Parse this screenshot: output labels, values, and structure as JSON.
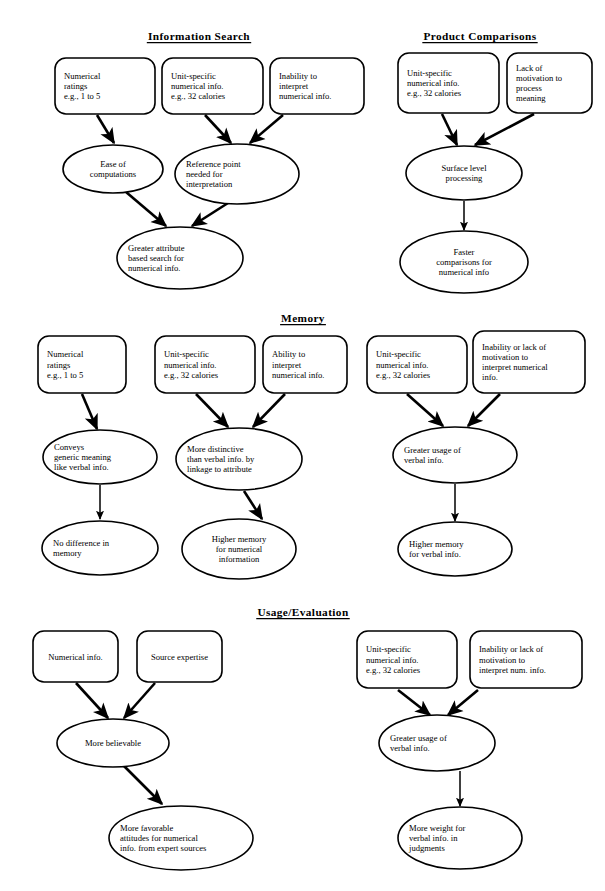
{
  "document": {
    "type": "conceptual-flowchart",
    "description": "Three-panel process model diagram of numerical versus verbal information effects"
  },
  "sections": [
    {
      "id": "information-search",
      "title": "Information Search",
      "nodes": [
        {
          "id": "is-n1",
          "shape": "rounded-rect",
          "lines": [
            "Numerical",
            "ratings",
            "e.g., 1 to 5"
          ]
        },
        {
          "id": "is-n2",
          "shape": "rounded-rect",
          "lines": [
            "Unit-specific",
            "numerical info.",
            "e.g., 32 calories"
          ]
        },
        {
          "id": "is-n3",
          "shape": "rounded-rect",
          "lines": [
            "Inability to",
            "interpret",
            "numerical info."
          ]
        },
        {
          "id": "is-n4",
          "shape": "ellipse",
          "lines": [
            "Ease of",
            "computations"
          ]
        },
        {
          "id": "is-n5",
          "shape": "ellipse",
          "lines": [
            "Reference point",
            "needed for",
            "interpretation"
          ]
        },
        {
          "id": "is-n6",
          "shape": "ellipse",
          "lines": [
            "Greater attribute",
            "based search for",
            "numerical info."
          ]
        }
      ],
      "edges": [
        {
          "from": "is-n1",
          "to": "is-n4"
        },
        {
          "from": "is-n2",
          "to": "is-n5"
        },
        {
          "from": "is-n3",
          "to": "is-n5"
        },
        {
          "from": "is-n4",
          "to": "is-n6"
        },
        {
          "from": "is-n5",
          "to": "is-n6"
        }
      ]
    },
    {
      "id": "product-comparisons",
      "title": "Product Comparisons",
      "nodes": [
        {
          "id": "pc-n1",
          "shape": "rounded-rect",
          "lines": [
            "Unit-specific",
            "numerical info.",
            "e.g., 32 calories"
          ]
        },
        {
          "id": "pc-n2",
          "shape": "rounded-rect",
          "lines": [
            "Lack of",
            "motivation to",
            "process",
            "meaning"
          ]
        },
        {
          "id": "pc-n3",
          "shape": "ellipse",
          "lines": [
            "Surface level",
            "processing"
          ]
        },
        {
          "id": "pc-n4",
          "shape": "ellipse",
          "lines": [
            "Faster",
            "comparisons for",
            "numerical info"
          ]
        }
      ],
      "edges": [
        {
          "from": "pc-n1",
          "to": "pc-n3"
        },
        {
          "from": "pc-n2",
          "to": "pc-n3"
        },
        {
          "from": "pc-n3",
          "to": "pc-n4"
        }
      ]
    },
    {
      "id": "memory",
      "title": "Memory",
      "nodes": [
        {
          "id": "me-n1",
          "shape": "rounded-rect",
          "lines": [
            "Numerical",
            "ratings",
            "e.g., 1 to 5"
          ]
        },
        {
          "id": "me-n2",
          "shape": "rounded-rect",
          "lines": [
            "Unit-specific",
            "numerical info.",
            "e.g., 32 calories"
          ]
        },
        {
          "id": "me-n3",
          "shape": "rounded-rect",
          "lines": [
            "Ability to",
            "interpret",
            "numerical info."
          ]
        },
        {
          "id": "me-n4",
          "shape": "rounded-rect",
          "lines": [
            "Unit-specific",
            "numerical info.",
            "e.g., 32 calories"
          ]
        },
        {
          "id": "me-n5",
          "shape": "rounded-rect",
          "lines": [
            "Inability or lack of",
            "motivation to",
            "interpret numerical",
            "info."
          ]
        },
        {
          "id": "me-n6",
          "shape": "ellipse",
          "lines": [
            "Conveys",
            "generic meaning",
            "like verbal info."
          ]
        },
        {
          "id": "me-n7",
          "shape": "ellipse",
          "lines": [
            "More distinctive",
            "than verbal info. by",
            "linkage to attribute"
          ]
        },
        {
          "id": "me-n8",
          "shape": "ellipse",
          "lines": [
            "Greater usage of",
            "verbal info."
          ]
        },
        {
          "id": "me-n9",
          "shape": "ellipse",
          "lines": [
            "No difference in",
            "memory"
          ]
        },
        {
          "id": "me-n10",
          "shape": "ellipse",
          "lines": [
            "Higher memory",
            "for numerical",
            "information"
          ]
        },
        {
          "id": "me-n11",
          "shape": "ellipse",
          "lines": [
            "Higher memory",
            "for verbal info."
          ]
        }
      ],
      "edges": [
        {
          "from": "me-n1",
          "to": "me-n6"
        },
        {
          "from": "me-n2",
          "to": "me-n7"
        },
        {
          "from": "me-n3",
          "to": "me-n7"
        },
        {
          "from": "me-n4",
          "to": "me-n8"
        },
        {
          "from": "me-n5",
          "to": "me-n8"
        },
        {
          "from": "me-n6",
          "to": "me-n9"
        },
        {
          "from": "me-n7",
          "to": "me-n10"
        },
        {
          "from": "me-n8",
          "to": "me-n11"
        }
      ]
    },
    {
      "id": "usage-evaluation",
      "title": "Usage/Evaluation",
      "nodes": [
        {
          "id": "ue-n1",
          "shape": "rounded-rect",
          "lines": [
            "Numerical info."
          ]
        },
        {
          "id": "ue-n2",
          "shape": "rounded-rect",
          "lines": [
            "Source expertise"
          ]
        },
        {
          "id": "ue-n3",
          "shape": "rounded-rect",
          "lines": [
            "Unit-specific",
            "numerical info.",
            "e.g., 32 calories"
          ]
        },
        {
          "id": "ue-n4",
          "shape": "rounded-rect",
          "lines": [
            "Inability or lack of",
            "motivation to",
            "interpret num. info."
          ]
        },
        {
          "id": "ue-n5",
          "shape": "ellipse",
          "lines": [
            "More believable"
          ]
        },
        {
          "id": "ue-n6",
          "shape": "ellipse",
          "lines": [
            "Greater usage of",
            "verbal info."
          ]
        },
        {
          "id": "ue-n7",
          "shape": "ellipse",
          "lines": [
            "More favorable",
            "attitudes for numerical",
            "info. from expert sources"
          ]
        },
        {
          "id": "ue-n8",
          "shape": "ellipse",
          "lines": [
            "More weight for",
            "verbal info. in",
            "judgments"
          ]
        }
      ],
      "edges": [
        {
          "from": "ue-n1",
          "to": "ue-n5"
        },
        {
          "from": "ue-n2",
          "to": "ue-n5"
        },
        {
          "from": "ue-n3",
          "to": "ue-n6"
        },
        {
          "from": "ue-n4",
          "to": "ue-n6"
        },
        {
          "from": "ue-n5",
          "to": "ue-n7"
        },
        {
          "from": "ue-n6",
          "to": "ue-n8"
        }
      ]
    }
  ],
  "colors": {
    "stroke": "#000000",
    "fill": "#ffffff",
    "text": "#000000",
    "background": "#ffffff"
  },
  "layout": {
    "titles": [
      {
        "id": "information-search",
        "cx": 199,
        "y": 40
      },
      {
        "id": "product-comparisons",
        "cx": 480,
        "y": 40
      },
      {
        "id": "memory",
        "cx": 303,
        "y": 322
      },
      {
        "id": "usage-evaluation",
        "cx": 303,
        "y": 616
      }
    ],
    "boxes": [
      {
        "id": "is-n1",
        "x": 55,
        "y": 58,
        "w": 100,
        "h": 56,
        "align": "left"
      },
      {
        "id": "is-n2",
        "x": 162,
        "y": 58,
        "w": 101,
        "h": 56,
        "align": "left"
      },
      {
        "id": "is-n3",
        "x": 270,
        "y": 58,
        "w": 94,
        "h": 56,
        "align": "left"
      },
      {
        "id": "pc-n1",
        "x": 398,
        "y": 53,
        "w": 101,
        "h": 60,
        "align": "left"
      },
      {
        "id": "pc-n2",
        "x": 507,
        "y": 53,
        "w": 85,
        "h": 60,
        "align": "left"
      },
      {
        "id": "me-n1",
        "x": 38,
        "y": 336,
        "w": 88,
        "h": 57,
        "align": "left"
      },
      {
        "id": "me-n2",
        "x": 155,
        "y": 336,
        "w": 100,
        "h": 57,
        "align": "left"
      },
      {
        "id": "me-n3",
        "x": 263,
        "y": 336,
        "w": 84,
        "h": 57,
        "align": "left"
      },
      {
        "id": "me-n4",
        "x": 367,
        "y": 336,
        "w": 100,
        "h": 57,
        "align": "left"
      },
      {
        "id": "me-n5",
        "x": 473,
        "y": 331,
        "w": 112,
        "h": 62,
        "align": "left"
      },
      {
        "id": "ue-n1",
        "x": 33,
        "y": 631,
        "w": 85,
        "h": 51,
        "align": "center"
      },
      {
        "id": "ue-n2",
        "x": 137,
        "y": 631,
        "w": 85,
        "h": 51,
        "align": "center"
      },
      {
        "id": "ue-n3",
        "x": 357,
        "y": 631,
        "w": 100,
        "h": 57,
        "align": "left"
      },
      {
        "id": "ue-n4",
        "x": 470,
        "y": 631,
        "w": 112,
        "h": 57,
        "align": "left"
      }
    ],
    "ellipses": [
      {
        "id": "is-n4",
        "cx": 113,
        "cy": 169,
        "rx": 50,
        "ry": 24,
        "align": "center"
      },
      {
        "id": "is-n5",
        "cx": 237,
        "cy": 174,
        "rx": 62,
        "ry": 30,
        "align": "left"
      },
      {
        "id": "is-n6",
        "cx": 180,
        "cy": 258,
        "rx": 63,
        "ry": 31,
        "align": "left"
      },
      {
        "id": "pc-n3",
        "cx": 464,
        "cy": 173,
        "rx": 58,
        "ry": 27,
        "align": "center"
      },
      {
        "id": "pc-n4",
        "cx": 464,
        "cy": 262,
        "rx": 64,
        "ry": 31,
        "align": "center"
      },
      {
        "id": "me-n6",
        "cx": 100,
        "cy": 457,
        "rx": 57,
        "ry": 27,
        "align": "left"
      },
      {
        "id": "me-n7",
        "cx": 239,
        "cy": 459,
        "rx": 63,
        "ry": 31,
        "align": "left"
      },
      {
        "id": "me-n8",
        "cx": 455,
        "cy": 455,
        "rx": 62,
        "ry": 28,
        "align": "left"
      },
      {
        "id": "me-n9",
        "cx": 100,
        "cy": 548,
        "rx": 58,
        "ry": 27,
        "align": "left"
      },
      {
        "id": "me-n10",
        "cx": 239,
        "cy": 549,
        "rx": 57,
        "ry": 30,
        "align": "center"
      },
      {
        "id": "me-n11",
        "cx": 455,
        "cy": 549,
        "rx": 57,
        "ry": 27,
        "align": "left"
      },
      {
        "id": "ue-n5",
        "cx": 113,
        "cy": 743,
        "rx": 56,
        "ry": 24,
        "align": "center"
      },
      {
        "id": "ue-n6",
        "cx": 437,
        "cy": 743,
        "rx": 58,
        "ry": 28,
        "align": "left"
      },
      {
        "id": "ue-n7",
        "cx": 181,
        "cy": 838,
        "rx": 72,
        "ry": 32,
        "align": "left"
      },
      {
        "id": "ue-n8",
        "cx": 460,
        "cy": 838,
        "rx": 62,
        "ry": 31,
        "align": "left"
      }
    ],
    "arrows": [
      {
        "from": "is-n1",
        "to": "is-n4",
        "x1": 97,
        "y1": 115,
        "x2": 114,
        "y2": 143
      },
      {
        "from": "is-n2",
        "to": "is-n5",
        "x1": 205,
        "y1": 115,
        "x2": 231,
        "y2": 143
      },
      {
        "from": "is-n3",
        "to": "is-n5",
        "x1": 283,
        "y1": 115,
        "x2": 250,
        "y2": 143
      },
      {
        "from": "is-n4",
        "to": "is-n6",
        "x1": 126,
        "y1": 192,
        "x2": 166,
        "y2": 226
      },
      {
        "from": "is-n5",
        "to": "is-n6",
        "x1": 228,
        "y1": 203,
        "x2": 192,
        "y2": 226
      },
      {
        "from": "pc-n1",
        "to": "pc-n3",
        "x1": 442,
        "y1": 114,
        "x2": 457,
        "y2": 145
      },
      {
        "from": "pc-n2",
        "to": "pc-n3",
        "x1": 534,
        "y1": 114,
        "x2": 475,
        "y2": 145
      },
      {
        "from": "pc-n3",
        "to": "pc-n4",
        "x1": 464,
        "y1": 201,
        "x2": 464,
        "y2": 230
      },
      {
        "from": "me-n1",
        "to": "me-n6",
        "x1": 82,
        "y1": 394,
        "x2": 97,
        "y2": 429
      },
      {
        "from": "me-n2",
        "to": "me-n7",
        "x1": 196,
        "y1": 394,
        "x2": 228,
        "y2": 427
      },
      {
        "from": "me-n3",
        "to": "me-n7",
        "x1": 285,
        "y1": 394,
        "x2": 253,
        "y2": 427
      },
      {
        "from": "me-n4",
        "to": "me-n8",
        "x1": 407,
        "y1": 394,
        "x2": 443,
        "y2": 426
      },
      {
        "from": "me-n5",
        "to": "me-n8",
        "x1": 500,
        "y1": 394,
        "x2": 468,
        "y2": 426
      },
      {
        "from": "me-n6",
        "to": "me-n9",
        "x1": 100,
        "y1": 485,
        "x2": 100,
        "y2": 519
      },
      {
        "from": "me-n7",
        "to": "me-n10",
        "x1": 244,
        "y1": 491,
        "x2": 262,
        "y2": 519
      },
      {
        "from": "me-n8",
        "to": "me-n11",
        "x1": 455,
        "y1": 484,
        "x2": 455,
        "y2": 521
      },
      {
        "from": "ue-n1",
        "to": "ue-n5",
        "x1": 76,
        "y1": 683,
        "x2": 108,
        "y2": 718
      },
      {
        "from": "ue-n2",
        "to": "ue-n5",
        "x1": 155,
        "y1": 683,
        "x2": 124,
        "y2": 718
      },
      {
        "from": "ue-n3",
        "to": "ue-n6",
        "x1": 398,
        "y1": 690,
        "x2": 430,
        "y2": 715
      },
      {
        "from": "ue-n4",
        "to": "ue-n6",
        "x1": 478,
        "y1": 690,
        "x2": 448,
        "y2": 715
      },
      {
        "from": "ue-n5",
        "to": "ue-n7",
        "x1": 124,
        "y1": 766,
        "x2": 162,
        "y2": 804
      },
      {
        "from": "ue-n6",
        "to": "ue-n8",
        "x1": 460,
        "y1": 771,
        "x2": 460,
        "y2": 806
      }
    ]
  }
}
